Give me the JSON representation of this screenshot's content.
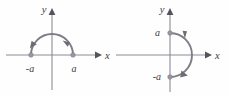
{
  "figure": {
    "background_color": "#fefefe",
    "curve_color": "#807c86",
    "axis_color": "#8d8a93",
    "label_color": "#3d3a42",
    "point_color": "#9a96a1"
  },
  "panels": [
    {
      "id": "left",
      "name": "upper-semicircle-counterclockwise",
      "axes": {
        "x_label": "x",
        "y_label": "y",
        "origin": {
          "x": 52,
          "y": 55
        }
      },
      "curve": {
        "type": "semicircle",
        "half_plane": "upper",
        "radius": 21,
        "orientation": "counterclockwise",
        "start_point_label": "a",
        "end_point_label": "-a",
        "arrow_count": 2
      },
      "point_labels": [
        {
          "text": "-a",
          "position": "left-endpoint"
        },
        {
          "text": "a",
          "position": "right-endpoint"
        }
      ]
    },
    {
      "id": "right",
      "name": "right-semicircle-clockwise",
      "axes": {
        "x_label": "x",
        "y_label": "y",
        "origin": {
          "x": 56,
          "y": 55
        }
      },
      "curve": {
        "type": "semicircle",
        "half_plane": "right",
        "radius": 22,
        "orientation": "clockwise",
        "start_point_label": "a",
        "end_point_label": "-a",
        "arrow_count": 2
      },
      "point_labels": [
        {
          "text": "a",
          "position": "top-endpoint"
        },
        {
          "text": "-a",
          "position": "bottom-endpoint"
        }
      ]
    }
  ]
}
